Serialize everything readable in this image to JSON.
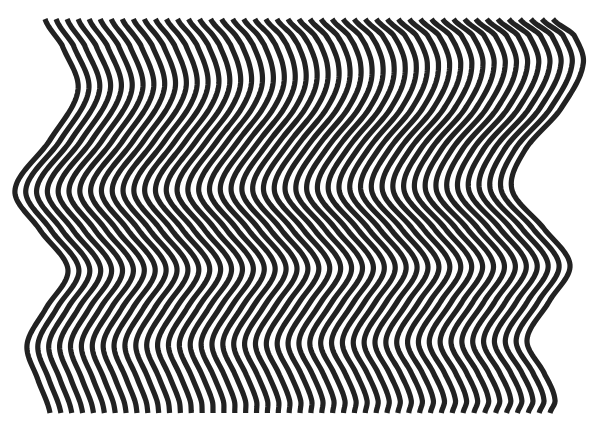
{
  "artwork": {
    "description": "Op-art pattern of wavy vertical black stripes",
    "background_color": "#ffffff",
    "stroke_color": "#222222",
    "line_count": 47,
    "stroke_width": 5.2,
    "y_top": 19,
    "y_bottom": 413,
    "left_edge_curve": [
      [
        19,
        45
      ],
      [
        45,
        62
      ],
      [
        90,
        78
      ],
      [
        140,
        50
      ],
      [
        190,
        15
      ],
      [
        230,
        40
      ],
      [
        270,
        68
      ],
      [
        310,
        45
      ],
      [
        345,
        27
      ],
      [
        380,
        38
      ],
      [
        413,
        50
      ]
    ],
    "right_edge_curve": [
      [
        19,
        553
      ],
      [
        35,
        574
      ],
      [
        65,
        583
      ],
      [
        110,
        560
      ],
      [
        150,
        525
      ],
      [
        190,
        512
      ],
      [
        230,
        545
      ],
      [
        265,
        570
      ],
      [
        300,
        550
      ],
      [
        340,
        527
      ],
      [
        375,
        545
      ],
      [
        400,
        555
      ],
      [
        413,
        550
      ]
    ]
  }
}
